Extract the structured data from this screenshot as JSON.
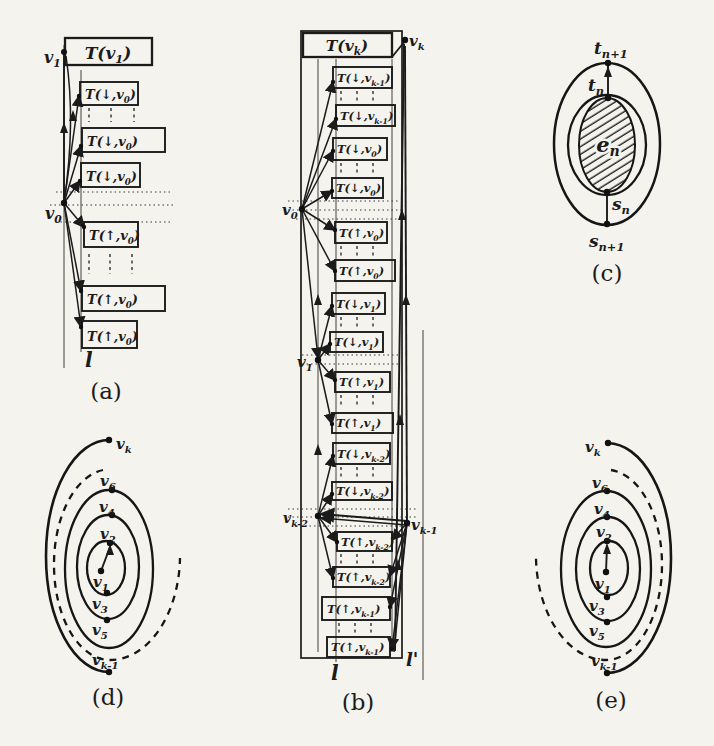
{
  "colors": {
    "background": "#f5f3ee",
    "ink": "#1b1b1b"
  },
  "panels": {
    "a": {
      "caption": "(a)",
      "v1": {
        "pre": "v",
        "sub": "1"
      },
      "v0": {
        "pre": "v",
        "sub": "0"
      },
      "l": {
        "pre": "l"
      },
      "root": {
        "pre": "T(v",
        "sub": "1",
        "post": ")"
      },
      "boxes": [
        {
          "pre": "T(↓,v",
          "sub": "0",
          "post": ")"
        },
        {
          "pre": "T(↓,v",
          "sub": "0",
          "post": ")"
        },
        {
          "pre": "T(↓,v",
          "sub": "0",
          "post": ")"
        },
        {
          "pre": "T(↑,v",
          "sub": "0",
          "post": ")"
        },
        {
          "pre": "T(↑,v",
          "sub": "0",
          "post": ")"
        },
        {
          "pre": "T(↑,v",
          "sub": "0",
          "post": ")"
        }
      ]
    },
    "b": {
      "caption": "(b)",
      "root": {
        "pre": "T(v",
        "sub": "k",
        "post": ")"
      },
      "vk": {
        "pre": "v",
        "sub": "k"
      },
      "v0": {
        "pre": "v",
        "sub": "0"
      },
      "v1": {
        "pre": "v",
        "sub": "1"
      },
      "vk2": {
        "pre": "v",
        "sub": "k-2"
      },
      "vk1": {
        "pre": "v",
        "sub": "k-1"
      },
      "l": {
        "pre": "l"
      },
      "lp": {
        "pre": "l'"
      },
      "boxes": [
        {
          "pre": "T(↓,v",
          "sub": "k-1",
          "post": ")"
        },
        {
          "pre": "T(↓,v",
          "sub": "k-1",
          "post": ")"
        },
        {
          "pre": "T(↓,v",
          "sub": "0",
          "post": ")"
        },
        {
          "pre": "T(↓,v",
          "sub": "0",
          "post": ")"
        },
        {
          "pre": "T(↑,v",
          "sub": "0",
          "post": ")"
        },
        {
          "pre": "T(↑,v",
          "sub": "0",
          "post": ")"
        },
        {
          "pre": "T(↓,v",
          "sub": "1",
          "post": ")"
        },
        {
          "pre": "T(↓,v",
          "sub": "1",
          "post": ")"
        },
        {
          "pre": "T(↑,v",
          "sub": "1",
          "post": ")"
        },
        {
          "pre": "T(↑,v",
          "sub": "1",
          "post": ")"
        },
        {
          "pre": "T(↓,v",
          "sub": "k-2",
          "post": ")"
        },
        {
          "pre": "T(↓,v",
          "sub": "k-2",
          "post": ")"
        },
        {
          "pre": "T(↑,v",
          "sub": "k-2",
          "post": ")"
        },
        {
          "pre": "T(↑,v",
          "sub": "k-2",
          "post": ")"
        },
        {
          "pre": "T(↑,v",
          "sub": "k-1",
          "post": ")"
        },
        {
          "pre": "T(↑,v",
          "sub": "k-1",
          "post": ")"
        }
      ]
    },
    "c": {
      "caption": "(c)",
      "tn1": {
        "pre": "t",
        "sub": "n+1"
      },
      "tn": {
        "pre": "t",
        "sub": "n"
      },
      "en": {
        "pre": "e",
        "sub": "n"
      },
      "sn": {
        "pre": "s",
        "sub": "n"
      },
      "sn1": {
        "pre": "s",
        "sub": "n+1"
      }
    },
    "d": {
      "caption": "(d)",
      "vk": {
        "pre": "v",
        "sub": "k"
      },
      "v6": {
        "pre": "v",
        "sub": "6"
      },
      "v4": {
        "pre": "v",
        "sub": "4"
      },
      "v2": {
        "pre": "v",
        "sub": "2"
      },
      "v1": {
        "pre": "v",
        "sub": "1"
      },
      "v3": {
        "pre": "v",
        "sub": "3"
      },
      "v5": {
        "pre": "v",
        "sub": "5"
      },
      "vk1": {
        "pre": "v",
        "sub": "k-1"
      }
    },
    "e": {
      "caption": "(e)",
      "vk": {
        "pre": "v",
        "sub": "k"
      },
      "v6": {
        "pre": "v",
        "sub": "6"
      },
      "v4": {
        "pre": "v",
        "sub": "4"
      },
      "v2": {
        "pre": "v",
        "sub": "2"
      },
      "v1": {
        "pre": "v",
        "sub": "1"
      },
      "v3": {
        "pre": "v",
        "sub": "3"
      },
      "v5": {
        "pre": "v",
        "sub": "5"
      },
      "vk1": {
        "pre": "v",
        "sub": "k-1"
      }
    }
  }
}
